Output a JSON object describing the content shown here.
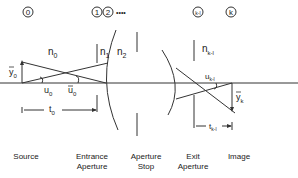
{
  "surfaces": {
    "s0": "0",
    "s1": "1",
    "s2": "2",
    "dots": "••••",
    "sk1": "k-l",
    "sk": "k"
  },
  "media": {
    "n0": "n",
    "n0_sub": "0",
    "n1": "n",
    "n1_sub": "1",
    "n2": "n",
    "n2_sub": "2",
    "nk1": "n",
    "nk1_sub": "k-l"
  },
  "symbols": {
    "y0": "y",
    "y0_sub": "0",
    "u0": "u",
    "u0_sub": "0",
    "ubar0": "u",
    "ubar0_sub": "0",
    "t0": "t",
    "t0_sub": "0",
    "uk1": "u",
    "uk1_sub": "k-l",
    "yk": "y",
    "yk_sub": "k",
    "tk1": "t",
    "tk1_sub": "k-l"
  },
  "bottom_labels": {
    "source": "Source",
    "entrance_1": "Entrance",
    "entrance_2": "Aperture",
    "stop_1": "Aperture",
    "stop_2": "Stop",
    "exit_1": "Exit",
    "exit_2": "Aperture",
    "image": "Image"
  }
}
